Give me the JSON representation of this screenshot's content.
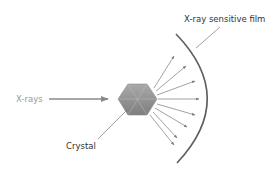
{
  "diagram": {
    "labels": {
      "xrays": "X-rays",
      "crystal": "Crystal",
      "film": "X-ray sensitive film"
    },
    "colors": {
      "line": "#7a7a7a",
      "film": "#5a5a5a",
      "text_dark": "#333333",
      "text_light": "#999999",
      "crystal_light": "#a8a8a8",
      "crystal_dark": "#7c7c7c"
    },
    "scattered_ray_count": 8
  }
}
